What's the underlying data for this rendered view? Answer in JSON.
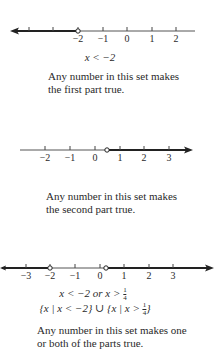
{
  "figure": {
    "panels": [
      {
        "id": "first-part",
        "axis": {
          "y": 31,
          "x_start": 12,
          "x_end": 195,
          "arrow": "left"
        },
        "ticks": [
          {
            "x": 29,
            "label": ""
          },
          {
            "x": 53,
            "label": ""
          },
          {
            "x": 78,
            "label": "−2"
          },
          {
            "x": 103,
            "label": "−1"
          },
          {
            "x": 127,
            "label": "0"
          },
          {
            "x": 152,
            "label": "1"
          },
          {
            "x": 176,
            "label": "2"
          }
        ],
        "open_points": [
          78
        ],
        "shaded": [
          [
            12,
            78
          ]
        ],
        "inequality": "x < −2",
        "caption": [
          "Any number in this set makes",
          "the first part true."
        ]
      },
      {
        "id": "second-part",
        "axis": {
          "y": 150,
          "x_start": 20,
          "x_end": 192,
          "arrow": "right"
        },
        "ticks": [
          {
            "x": 45,
            "label": "−2"
          },
          {
            "x": 70,
            "label": "−1"
          },
          {
            "x": 95,
            "label": "0"
          },
          {
            "x": 120,
            "label": "1"
          },
          {
            "x": 144,
            "label": "2"
          },
          {
            "x": 169,
            "label": "3"
          }
        ],
        "open_points": [
          107
        ],
        "shaded": [
          [
            107,
            192
          ]
        ],
        "caption": [
          "Any number in this set makes",
          "the second part true."
        ]
      },
      {
        "id": "union",
        "axis": {
          "y": 268,
          "x_start": 0,
          "x_end": 213,
          "arrow": "both"
        },
        "ticks": [
          {
            "x": 26,
            "label": "−3"
          },
          {
            "x": 50,
            "label": "−2"
          },
          {
            "x": 75,
            "label": "−1"
          },
          {
            "x": 100,
            "label": "0"
          },
          {
            "x": 124,
            "label": "1"
          },
          {
            "x": 149,
            "label": "2"
          },
          {
            "x": 173,
            "label": "3"
          }
        ],
        "open_points": [
          50,
          106
        ],
        "shaded": [
          [
            0,
            50
          ],
          [
            106,
            213
          ]
        ],
        "inequality_prefix": "x < −2 or x > ",
        "set_left": "{x | x < −2}",
        "union_symbol": "∪",
        "set_right_prefix": "{x | x > ",
        "set_right_suffix": "}",
        "fraction": {
          "num": "1",
          "den": "4"
        },
        "caption": [
          "Any number in this set makes one",
          "or both of the parts true."
        ]
      }
    ]
  }
}
